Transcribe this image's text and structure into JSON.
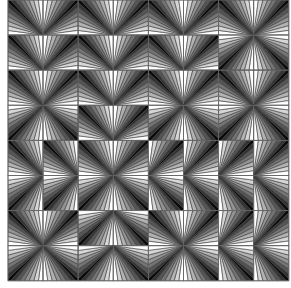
{
  "pattern": {
    "title": "",
    "grid": {
      "rows": 8,
      "cols": 8,
      "origin_x": 8,
      "origin_y": 0,
      "tile_size": 35.1
    },
    "wedge_colors": [
      "#ffffff",
      "#d6d6d6",
      "#b2b2b2",
      "#939393",
      "#747474",
      "#555555",
      "#333333",
      "#0a0a0a"
    ],
    "outline_color": "#3a3a3a",
    "dark_corners": [
      [
        "BR",
        "BL",
        "BR",
        "BL",
        "BR",
        "BL",
        "BR",
        "BL"
      ],
      [
        "BR",
        "BL",
        "BR",
        "BL",
        "BR",
        "BL",
        "TR",
        "TL"
      ],
      [
        "BR",
        "BL",
        "BR",
        "BL",
        "BR",
        "BL",
        "BR",
        "BL"
      ],
      [
        "TR",
        "TL",
        "BR",
        "BL",
        "TR",
        "TL",
        "TR",
        "TL"
      ],
      [
        "BR",
        "BR",
        "BR",
        "BL",
        "BL",
        "BL",
        "BL",
        "BL"
      ],
      [
        "TR",
        "TR",
        "TR",
        "TL",
        "TL",
        "TL",
        "TL",
        "TL"
      ],
      [
        "BR",
        "BL",
        "TR",
        "TL",
        "BR",
        "BL",
        "BL",
        "BL"
      ],
      [
        "TR",
        "TL",
        "TR",
        "TL",
        "TR",
        "TL",
        "TL",
        "TL"
      ]
    ]
  }
}
